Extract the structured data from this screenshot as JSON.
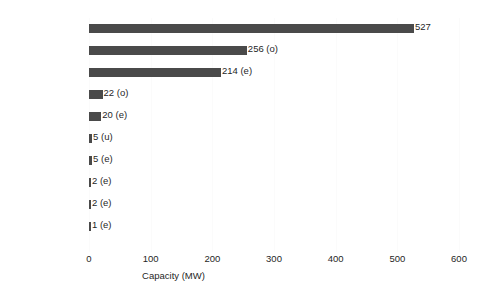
{
  "chart_data": {
    "type": "bar",
    "orientation": "horizontal",
    "title": "",
    "xlabel": "Capacity (MW)",
    "ylabel": "",
    "xlim": [
      0,
      600
    ],
    "xticks": [
      0,
      100,
      200,
      300,
      400,
      500,
      600
    ],
    "xtick_labels": [
      "0",
      "100",
      "200",
      "300",
      "400",
      "500",
      "600"
    ],
    "grid": true,
    "grid_axis": "x",
    "legend": false,
    "bar_color": "#4a4a4a",
    "background_color": "#ffffff",
    "categories": [
      "World",
      "South Korea",
      "France",
      "UK",
      "Canada",
      "China",
      "Spain",
      "Russia",
      "Netherlands",
      "Australia"
    ],
    "values": [
      527,
      256,
      214,
      22,
      20,
      5,
      5,
      2,
      2,
      1
    ],
    "data_labels": [
      "527",
      "256 (o)",
      "214 (e)",
      "22 (o)",
      "20 (e)",
      "5 (u)",
      "5 (e)",
      "2 (e)",
      "2 (e)",
      "1 (e)"
    ],
    "qualifiers": [
      "",
      "o",
      "e",
      "o",
      "e",
      "u",
      "e",
      "e",
      "e",
      "e"
    ],
    "rows": [
      {
        "category": "World",
        "value": 527,
        "label": "527"
      },
      {
        "category": "South Korea",
        "value": 256,
        "label": "256 (o)"
      },
      {
        "category": "France",
        "value": 214,
        "label": "214 (e)"
      },
      {
        "category": "UK",
        "value": 22,
        "label": "22 (o)"
      },
      {
        "category": "Canada",
        "value": 20,
        "label": "20 (e)"
      },
      {
        "category": "China",
        "value": 5,
        "label": "5 (u)"
      },
      {
        "category": "Spain",
        "value": 5,
        "label": "5 (e)"
      },
      {
        "category": "Russia",
        "value": 2,
        "label": "2 (e)"
      },
      {
        "category": "Netherlands",
        "value": 2,
        "label": "2 (e)"
      },
      {
        "category": "Australia",
        "value": 1,
        "label": "1 (e)"
      }
    ]
  }
}
